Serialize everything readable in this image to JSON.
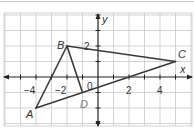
{
  "figure": {
    "type": "coordinate-plane",
    "axes": {
      "x_label": "x",
      "y_label": "y",
      "x_ticks": [
        {
          "value": -4,
          "label": "−4"
        },
        {
          "value": -2,
          "label": "−2"
        },
        {
          "value": 2,
          "label": "2"
        },
        {
          "value": 4,
          "label": "4"
        }
      ],
      "y_ticks": [
        {
          "value": 2,
          "label": "2"
        }
      ],
      "origin_label": "0",
      "x_range": [
        -6,
        6
      ],
      "y_range": [
        -4,
        4
      ],
      "grid": true
    },
    "points": [
      {
        "name": "A",
        "x": -4,
        "y": -2
      },
      {
        "name": "B",
        "x": -2,
        "y": 2
      },
      {
        "name": "C",
        "x": 5,
        "y": 1
      },
      {
        "name": "D",
        "x": -1,
        "y": -1
      }
    ],
    "segments": [
      {
        "from": "A",
        "to": "B"
      },
      {
        "from": "B",
        "to": "C"
      },
      {
        "from": "C",
        "to": "A"
      },
      {
        "from": "B",
        "to": "D"
      }
    ],
    "colors": {
      "grid": "#c8c8c8",
      "axis": "#222222",
      "segment": "#3a3a3a",
      "label": "#333333",
      "label_faded": "#7a7a7a"
    }
  }
}
